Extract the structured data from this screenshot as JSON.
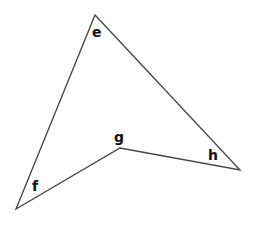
{
  "diagram": {
    "type": "polygon",
    "stroke_color": "#444444",
    "vertices": [
      {
        "name": "e",
        "x": 95,
        "y": 15,
        "label": "e",
        "label_x": 98,
        "label_y": 37
      },
      {
        "name": "h",
        "x": 240,
        "y": 170,
        "label": "h",
        "label_x": 214,
        "label_y": 160
      },
      {
        "name": "g",
        "x": 120,
        "y": 148,
        "label": "g",
        "label_x": 119,
        "label_y": 142
      },
      {
        "name": "f",
        "x": 16,
        "y": 209,
        "label": "f",
        "label_x": 36,
        "label_y": 191
      }
    ],
    "edges": [
      [
        "e",
        "h"
      ],
      [
        "h",
        "g"
      ],
      [
        "g",
        "f"
      ],
      [
        "f",
        "e"
      ]
    ]
  }
}
